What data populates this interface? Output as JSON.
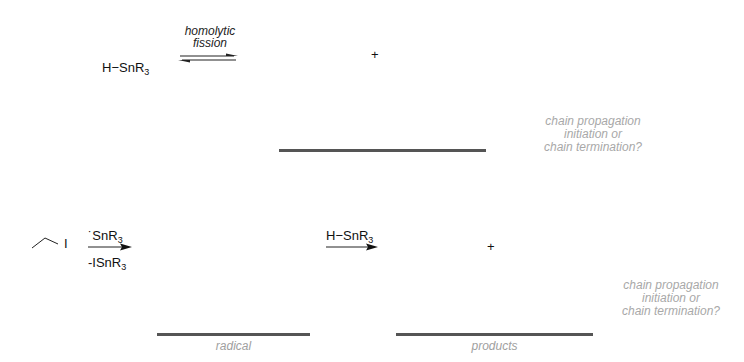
{
  "scheme1": {
    "reactant": "H−SnR",
    "reactant_sub": "3",
    "arrow_label_line1": "homolytic",
    "arrow_label_line2": "fission",
    "arrow_type": "equilibrium",
    "plus": "+",
    "question_line1": "chain propagation",
    "question_line2": "initiation or",
    "question_line3": "chain termination?"
  },
  "scheme2": {
    "reactant": "ethyl iodide (skeletal)",
    "reactant_atom": "I",
    "arrow1_above": "˙SnR",
    "arrow1_above_sub": "3",
    "arrow1_below": "-ISnR",
    "arrow1_below_sub": "3",
    "arrow2_above": "H−SnR",
    "arrow2_above_sub": "3",
    "plus": "+",
    "blank1_label": "radical",
    "blank2_label": "products",
    "question_line1": "chain propagation",
    "question_line2": "initiation or",
    "question_line3": "chain termination?"
  },
  "colors": {
    "blank_line": "#555555",
    "hint_text": "#a8a8a8",
    "text": "#111111"
  }
}
